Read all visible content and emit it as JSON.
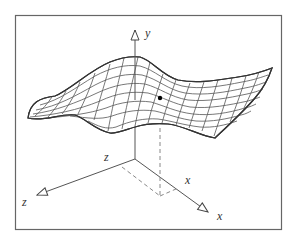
{
  "figure": {
    "type": "3d-surface-diagram",
    "frame": {
      "x": 15,
      "y": 15,
      "width": 267,
      "height": 215,
      "stroke": "#555555"
    },
    "axes": {
      "origin": [
        135,
        159
      ],
      "y": {
        "label": "y",
        "tip": [
          135,
          28
        ],
        "label_pos": [
          145,
          37
        ]
      },
      "z": {
        "label_near": "z",
        "label_far": "z",
        "tip": [
          35,
          196
        ],
        "label_near_pos": [
          104,
          161
        ],
        "label_far_pos": [
          22,
          206
        ]
      },
      "x": {
        "label_near": "x",
        "label_far": "x",
        "tip": [
          210,
          213
        ],
        "label_near_pos": [
          185,
          184
        ],
        "label_far_pos": [
          217,
          220
        ]
      }
    },
    "point": {
      "x": 160,
      "y": 98
    },
    "projection": {
      "foot": [
        160,
        196
      ],
      "z_corner": [
        122,
        167
      ],
      "x_corner": [
        176,
        190
      ]
    },
    "colors": {
      "line": "#444444",
      "grid": "#555555",
      "dashed": "#888888",
      "point": "#000000"
    }
  }
}
